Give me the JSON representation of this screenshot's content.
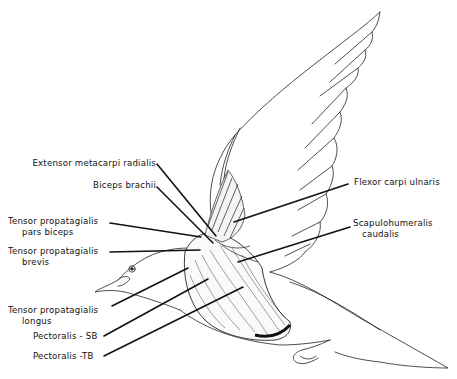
{
  "figure": {
    "labels_left": [
      {
        "id": "extensor-metacarpi-radialis",
        "text": "Extensor metacarpi radialis"
      },
      {
        "id": "biceps-brachii",
        "text": "Biceps brachii"
      },
      {
        "id": "tensor-propatagialis-pars-biceps",
        "line1": "Tensor propatagialis",
        "line2": "pars biceps"
      },
      {
        "id": "tensor-propatagialis-brevis",
        "line1": "Tensor propatagialis",
        "line2": "brevis"
      },
      {
        "id": "tensor-propatagialis-longus",
        "line1": "Tensor propatagialis",
        "line2": "longus"
      },
      {
        "id": "pectoralis-sb",
        "text": "Pectoralis - SB"
      },
      {
        "id": "pectoralis-tb",
        "text": "Pectoralis -TB"
      }
    ],
    "labels_right": [
      {
        "id": "flexor-carpi-ulnaris",
        "text": "Flexor carpi ulnaris"
      },
      {
        "id": "scapulohumeralis-caudalis",
        "line1": "Scapulohumeralis",
        "line2": "caudalis"
      }
    ],
    "colors": {
      "ink": "#111111",
      "background": "#ffffff"
    }
  }
}
